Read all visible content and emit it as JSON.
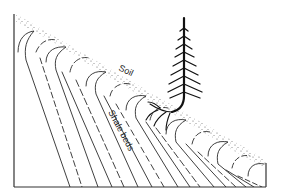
{
  "diagram": {
    "type": "geologic cross-section",
    "labels": {
      "soil": "Soil",
      "shale": "Shale beds"
    },
    "elements": [
      "frame",
      "soil-layer",
      "shale-beds",
      "conifer-tree",
      "tree-roots"
    ],
    "colors": {
      "ink": "#222222",
      "background": "#ffffff"
    }
  }
}
